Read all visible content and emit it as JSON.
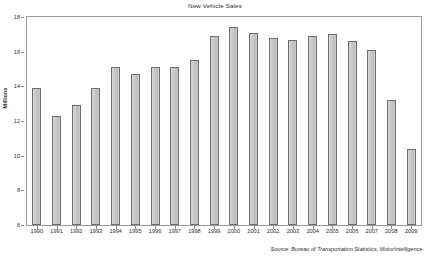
{
  "chart_data": {
    "type": "bar",
    "title": "New Vehicle Sales",
    "xlabel": "",
    "ylabel": "Millions",
    "ylim": [
      6,
      18
    ],
    "ytick_values": [
      18,
      16,
      14,
      12,
      10,
      8,
      6
    ],
    "ytick_labels": [
      "18",
      "16",
      "14",
      "12",
      "10",
      "8",
      "6"
    ],
    "grid": false,
    "legend": "none",
    "categories": [
      "1990",
      "1991",
      "1992",
      "1993",
      "1994",
      "1995",
      "1996",
      "1997",
      "1998",
      "1999",
      "2000",
      "2001",
      "2002",
      "2003",
      "2004",
      "2005",
      "2006",
      "2007",
      "2008",
      "2009"
    ],
    "values": [
      13.9,
      12.3,
      12.9,
      13.9,
      15.1,
      14.7,
      15.1,
      15.1,
      15.5,
      16.9,
      17.4,
      17.1,
      16.8,
      16.7,
      16.9,
      17.0,
      16.6,
      16.1,
      13.2,
      10.4
    ],
    "source": "Source: Bureau of Transportation Statistics, MotorIntelligence.",
    "bar_fill_color": "#c9c9c9",
    "bar_edge_color": "#6d6d6d",
    "frame_color": "#9a9a9a",
    "text_color": "#2b2b2b"
  }
}
